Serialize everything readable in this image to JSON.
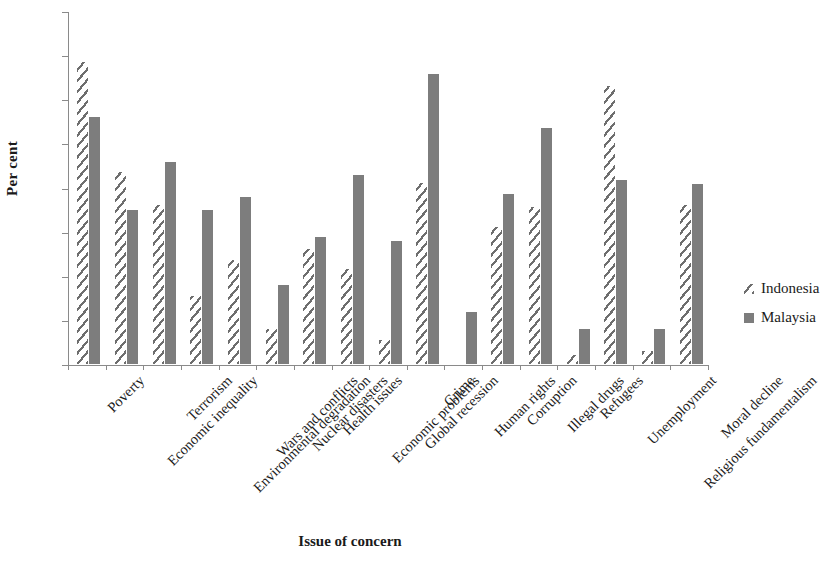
{
  "chart_data": {
    "type": "bar",
    "title": "",
    "xlabel": "Issue of concern",
    "ylabel": "Per cent",
    "ylim": [
      0,
      80
    ],
    "yticks": [
      0,
      10,
      20,
      30,
      40,
      50,
      60,
      70,
      80
    ],
    "grid": false,
    "legend_position": "right",
    "categories": [
      "Poverty",
      "Economic inequality",
      "Terrorism",
      "Environmental degradation",
      "Wars and conflicts",
      "Nuclear disasters",
      "Health issues",
      "Economic problems",
      "Global recession",
      "Crime",
      "Human rights",
      "Corruption",
      "Illegal drugs",
      "Refugees",
      "Unemployment",
      "Religious fundamentalism",
      "Moral decline"
    ],
    "series": [
      {
        "name": "Indonesia",
        "pattern": "diagonal-hatch",
        "color": "#6e6e6e",
        "values": [
          68.5,
          43.5,
          36.0,
          15.5,
          23.5,
          8.0,
          26.0,
          21.5,
          5.5,
          41.0,
          0.0,
          31.0,
          35.5,
          2.0,
          63.0,
          3.0,
          36.0
        ]
      },
      {
        "name": "Malaysia",
        "pattern": "solid",
        "color": "#7d7d7d",
        "values": [
          56.0,
          34.8,
          45.8,
          34.8,
          37.8,
          18.0,
          28.8,
          42.8,
          27.8,
          65.8,
          11.8,
          38.5,
          53.5,
          8.0,
          41.8,
          8.0,
          40.8
        ]
      }
    ],
    "note": "Categories rendered on the x-axis are the 15 labelled ticks; Human rights and Refugees Indonesia bars are near zero."
  },
  "axis": {
    "y_title": "Per cent",
    "x_title": "Issue of concern",
    "y_tick_labels": [
      "0",
      "10",
      "20",
      "30",
      "40",
      "50",
      "60",
      "70",
      "80"
    ]
  },
  "legend": {
    "items": [
      {
        "label": "Indonesia",
        "swatch": "hatch-swatch"
      },
      {
        "label": "Malaysia",
        "swatch": "solid-swatch"
      }
    ]
  },
  "xcategories": [
    "Poverty",
    "Economic inequality",
    "Terrorism",
    "Environmental degradation",
    "Wars and conflicts",
    "Nuclear disasters",
    "Health issues",
    "Economic problems",
    "Global recession",
    "Crime",
    "Human rights",
    "Corruption",
    "Illegal drugs",
    "Refugees",
    "Unemployment",
    "Religious fundamentalism",
    "Moral decline"
  ]
}
